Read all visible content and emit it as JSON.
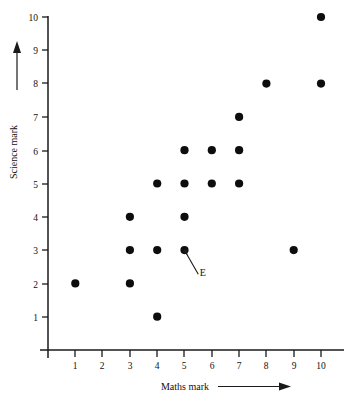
{
  "chart_data": {
    "type": "scatter",
    "title": "",
    "xlabel": "Maths mark",
    "ylabel": "Science mark",
    "xlim": [
      0,
      10
    ],
    "ylim": [
      0,
      10
    ],
    "xticks": [
      1,
      2,
      3,
      4,
      5,
      6,
      7,
      8,
      9,
      10
    ],
    "yticks": [
      1,
      2,
      3,
      4,
      5,
      6,
      7,
      8,
      9,
      10
    ],
    "xtick_labels": [
      "1",
      "2",
      "3",
      "4",
      "5",
      "6",
      "7",
      "8",
      "9",
      "10"
    ],
    "ytick_labels": [
      "1",
      "2",
      "3",
      "4",
      "5",
      "6",
      "7",
      "8",
      "9",
      "10"
    ],
    "grid": false,
    "legend": "none",
    "x_axis_arrow": true,
    "y_axis_arrow": true,
    "points": [
      {
        "x": 1,
        "y": 2
      },
      {
        "x": 3,
        "y": 2
      },
      {
        "x": 3,
        "y": 3
      },
      {
        "x": 3,
        "y": 4
      },
      {
        "x": 4,
        "y": 1
      },
      {
        "x": 4,
        "y": 3
      },
      {
        "x": 4,
        "y": 5
      },
      {
        "x": 5,
        "y": 3
      },
      {
        "x": 5,
        "y": 4
      },
      {
        "x": 5,
        "y": 5
      },
      {
        "x": 5,
        "y": 6
      },
      {
        "x": 6,
        "y": 5
      },
      {
        "x": 6,
        "y": 6
      },
      {
        "x": 7,
        "y": 5
      },
      {
        "x": 7,
        "y": 6
      },
      {
        "x": 7,
        "y": 7
      },
      {
        "x": 8,
        "y": 8
      },
      {
        "x": 9,
        "y": 3
      },
      {
        "x": 10,
        "y": 8
      },
      {
        "x": 10,
        "y": 10
      }
    ],
    "annotations": [
      {
        "label": "E",
        "points_to": {
          "x": 5,
          "y": 3
        },
        "label_x": 5.45,
        "label_y": 2.35
      }
    ]
  },
  "axes": {
    "x_title": "Maths mark",
    "y_title": "Science mark"
  },
  "ticks": {
    "x": [
      "1",
      "2",
      "3",
      "4",
      "5",
      "6",
      "7",
      "8",
      "9",
      "10"
    ],
    "y": [
      "1",
      "2",
      "3",
      "4",
      "5",
      "6",
      "7",
      "8",
      "9",
      "10"
    ]
  },
  "annotation": {
    "label": "E"
  }
}
